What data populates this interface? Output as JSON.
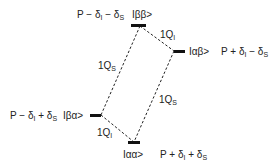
{
  "diagram": {
    "type": "energy-level-diagram",
    "colors": {
      "line": "#111111",
      "text": "#222222",
      "background": "#ffffff"
    },
    "levels": [
      {
        "id": "bb",
        "state": "Iββ>",
        "energy_label": {
          "base": "P − δ",
          "s1": "I",
          "mid": " − δ",
          "s2": "S"
        }
      },
      {
        "id": "ab",
        "state": "Iαβ>",
        "energy_label": {
          "base": "P + δ",
          "s1": "I",
          "mid": " − δ",
          "s2": "S"
        }
      },
      {
        "id": "ba",
        "state": "Iβα>",
        "energy_label": {
          "base": "P − δ",
          "s1": "I",
          "mid": " + δ",
          "s2": "S"
        }
      },
      {
        "id": "aa",
        "state": "Iαα>",
        "energy_label": {
          "base": "P + δ",
          "s1": "I",
          "mid": " + δ",
          "s2": "S"
        }
      }
    ],
    "transitions": [
      {
        "from": "bb",
        "to": "ab",
        "label": {
          "main": "1Q",
          "sub": "I"
        }
      },
      {
        "from": "bb",
        "to": "ba",
        "label": {
          "main": "1Q",
          "sub": "S"
        }
      },
      {
        "from": "ab",
        "to": "aa",
        "label": {
          "main": "1Q",
          "sub": "S"
        }
      },
      {
        "from": "ba",
        "to": "aa",
        "label": {
          "main": "1Q",
          "sub": "I"
        }
      }
    ]
  }
}
